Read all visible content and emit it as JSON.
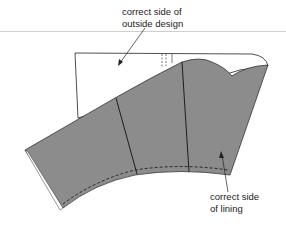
{
  "diagram": {
    "labels": {
      "outside_line1": "correct side of",
      "outside_line2": "outside design",
      "lining_line1": "correct side",
      "lining_line2": "of lining"
    },
    "colors": {
      "lining_fill": "#8c8c8c",
      "outline": "#222222",
      "background": "#ffffff"
    }
  }
}
